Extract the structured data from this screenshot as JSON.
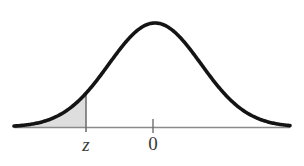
{
  "figure": {
    "background_color": "#ffffff"
  },
  "axis": {
    "line_color": "#8a8a8a",
    "baseline_y": 127,
    "x_start": 14,
    "x_end": 290,
    "ticks": [
      {
        "name": "z",
        "label": "z",
        "style": "italic",
        "x": 86
      },
      {
        "name": "zero",
        "label": "0",
        "style": "normal",
        "x": 153
      }
    ]
  },
  "curve": {
    "name": "normal-density-curve",
    "color": "#141414",
    "stroke_width": 3.6,
    "peak_x": 155,
    "peak_y": 23,
    "baseline_y": 127,
    "x_start": 14,
    "x_end": 290,
    "sigma_px": 46
  },
  "shaded_region": {
    "name": "left-tail-shaded-area",
    "fill_color": "#dedede",
    "edge_color": "#c4c4c4",
    "from_x": 14,
    "to_x": 86,
    "description": "area under curve to the left of z"
  },
  "boundary_line": {
    "name": "z-boundary-line",
    "color": "#6a6a6a",
    "x": 86,
    "y_top": 105,
    "y_bottom": 132
  },
  "chart_data": {
    "type": "line",
    "xlabel": "",
    "ylabel": "",
    "grid": false,
    "legend": null,
    "annotations": [
      "z",
      "0"
    ],
    "axis_tick_labels": [
      "z",
      "0"
    ],
    "xlim": [
      -3.05,
      2.95
    ],
    "ylim": [
      0,
      0.42
    ],
    "shaded_interval": [
      -3.05,
      -1.46
    ],
    "series": [
      {
        "name": "standard normal density",
        "x": [
          -3.05,
          -2.8,
          -2.6,
          -2.4,
          -2.2,
          -2.0,
          -1.8,
          -1.6,
          -1.46,
          -1.4,
          -1.2,
          -1.0,
          -0.8,
          -0.6,
          -0.4,
          -0.2,
          0.0,
          0.2,
          0.4,
          0.6,
          0.8,
          1.0,
          1.2,
          1.4,
          1.6,
          1.8,
          2.0,
          2.2,
          2.4,
          2.6,
          2.8,
          2.95
        ],
        "values": [
          0.004,
          0.008,
          0.014,
          0.022,
          0.035,
          0.054,
          0.079,
          0.111,
          0.137,
          0.15,
          0.194,
          0.242,
          0.29,
          0.333,
          0.368,
          0.391,
          0.399,
          0.391,
          0.368,
          0.333,
          0.29,
          0.242,
          0.194,
          0.15,
          0.111,
          0.079,
          0.054,
          0.035,
          0.022,
          0.014,
          0.008,
          0.005
        ]
      }
    ]
  }
}
